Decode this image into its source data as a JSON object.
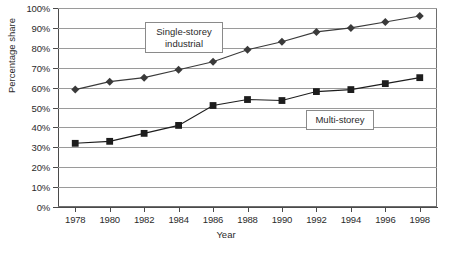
{
  "chart_data": {
    "type": "line",
    "title": "",
    "xlabel": "Year",
    "ylabel": "Percentage share",
    "x": [
      1978,
      1979,
      1980,
      1981,
      1982,
      1983,
      1984,
      1985,
      1986,
      1987,
      1988,
      1989,
      1990,
      1991,
      1992,
      1993,
      1994,
      1995,
      1996,
      1997,
      1998
    ],
    "x_tick_labels": [
      "1978",
      "1980",
      "1982",
      "1984",
      "1986",
      "1988",
      "1990",
      "1992",
      "1994",
      "1996",
      "1998"
    ],
    "x_tick_values": [
      1978,
      1980,
      1982,
      1984,
      1986,
      1988,
      1990,
      1992,
      1994,
      1996,
      1998
    ],
    "xlim": [
      1977,
      1999
    ],
    "y_tick_labels": [
      "0%",
      "10%",
      "20%",
      "30%",
      "40%",
      "50%",
      "60%",
      "70%",
      "80%",
      "90%",
      "100%"
    ],
    "y_tick_values": [
      0,
      10,
      20,
      30,
      40,
      50,
      60,
      70,
      80,
      90,
      100
    ],
    "ylim": [
      0,
      100
    ],
    "grid": true,
    "grid_axis": "y",
    "legend": "inline-callouts",
    "series": [
      {
        "name": "Single-storey industrial",
        "marker": "diamond",
        "color": "#3a3a3a",
        "x": [
          1978,
          1980,
          1982,
          1984,
          1986,
          1988,
          1990,
          1992,
          1994,
          1996,
          1998
        ],
        "values": [
          59,
          63,
          65,
          69,
          73,
          79,
          83,
          88,
          90,
          93,
          96
        ]
      },
      {
        "name": "Multi-storey",
        "marker": "square",
        "color": "#1d1d1d",
        "x": [
          1978,
          1980,
          1982,
          1984,
          1986,
          1988,
          1990,
          1992,
          1994,
          1996,
          1998
        ],
        "values": [
          32,
          33,
          37,
          41,
          51,
          54,
          53.5,
          58,
          59,
          62,
          65
        ]
      }
    ],
    "annotations": [
      {
        "id": "single",
        "text": "Single-storey\nindustrial"
      },
      {
        "id": "multi",
        "text": "Multi-storey"
      }
    ]
  },
  "colors": {
    "series_single": "#3a3a3a",
    "series_multi": "#1d1d1d",
    "gridline": "#9a9a9a",
    "axis": "#4a4a4a",
    "text": "#2b2b2b",
    "background": "#ffffff"
  }
}
